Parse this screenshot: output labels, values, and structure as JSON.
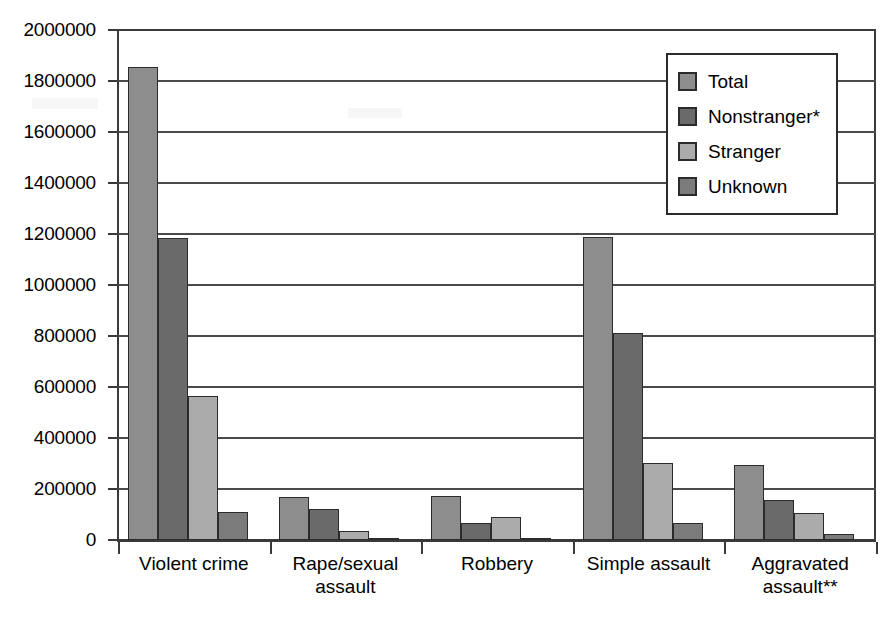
{
  "chart_data": {
    "type": "bar",
    "title": "",
    "subtitle": "",
    "xlabel": "",
    "ylabel": "",
    "ylim": [
      0,
      2000000
    ],
    "ytick_step": 200000,
    "ytick_labels": [
      "2000000",
      "1800000",
      "1600000",
      "1400000",
      "1200000",
      "1000000",
      "800000",
      "600000",
      "400000",
      "200000",
      "0"
    ],
    "ytick_values": [
      2000000,
      1800000,
      1600000,
      1400000,
      1200000,
      1000000,
      800000,
      600000,
      400000,
      200000,
      0
    ],
    "grid": true,
    "grid_axis": "y",
    "legend_position": "top-right",
    "categories": [
      "Violent crime",
      "Rape/sexual assault",
      "Robbery",
      "Simple assault",
      "Aggravated assault**"
    ],
    "category_lines": [
      [
        "Violent crime"
      ],
      [
        "Rape/sexual",
        "assault"
      ],
      [
        "Robbery"
      ],
      [
        "Simple assault"
      ],
      [
        "Aggravated",
        "assault**"
      ]
    ],
    "series": [
      {
        "name": "Total",
        "color": "#8d8d8d",
        "values": [
          1855000,
          167000,
          173000,
          1190000,
          293000
        ]
      },
      {
        "name": "Nonstranger*",
        "color": "#6a6a6a",
        "values": [
          1183000,
          122000,
          68000,
          810000,
          155000
        ]
      },
      {
        "name": "Stranger",
        "color": "#ababab",
        "values": [
          563000,
          37000,
          90000,
          303000,
          107000
        ]
      },
      {
        "name": "Unknown",
        "color": "#7b7b7b",
        "values": [
          110000,
          4000,
          5000,
          65000,
          22000
        ]
      }
    ],
    "footnotes": [
      "*",
      "**"
    ]
  },
  "legend": {
    "items": [
      {
        "label": "Total",
        "color": "#8d8d8d"
      },
      {
        "label": "Nonstranger*",
        "color": "#6a6a6a"
      },
      {
        "label": "Stranger",
        "color": "#ababab"
      },
      {
        "label": "Unknown",
        "color": "#7b7b7b"
      }
    ]
  },
  "colors": {
    "axis": "#3a3a3a",
    "gridline": "#4a4a4a",
    "bar_border": "#2b2b2b",
    "background": "#ffffff",
    "text": "#000000"
  }
}
